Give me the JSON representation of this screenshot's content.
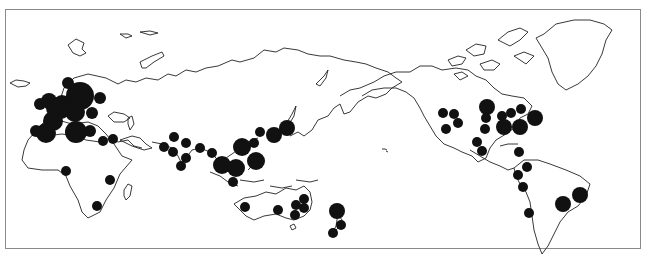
{
  "map": {
    "type": "proportional-symbol world map",
    "projection": "Pacific-centered (Europe/Africa at left, Americas at right)",
    "symbol_color": "#111111",
    "frame_color": "#8a8a8a",
    "regions": {
      "europe": [
        {
          "x": 68,
          "y": 83,
          "r": 6
        },
        {
          "x": 80,
          "y": 96,
          "r": 14
        },
        {
          "x": 62,
          "y": 104,
          "r": 9
        },
        {
          "x": 100,
          "y": 98,
          "r": 6
        },
        {
          "x": 40,
          "y": 104,
          "r": 6
        },
        {
          "x": 49,
          "y": 101,
          "r": 8
        },
        {
          "x": 56,
          "y": 108,
          "r": 10
        },
        {
          "x": 60,
          "y": 108,
          "r": 11
        },
        {
          "x": 75,
          "y": 112,
          "r": 10
        },
        {
          "x": 92,
          "y": 113,
          "r": 6
        },
        {
          "x": 53,
          "y": 121,
          "r": 10
        },
        {
          "x": 36,
          "y": 131,
          "r": 6
        },
        {
          "x": 46,
          "y": 133,
          "r": 10
        },
        {
          "x": 76,
          "y": 132,
          "r": 11
        },
        {
          "x": 90,
          "y": 131,
          "r": 6
        },
        {
          "x": 103,
          "y": 141,
          "r": 5
        },
        {
          "x": 113,
          "y": 139,
          "r": 5
        }
      ],
      "africa": [
        {
          "x": 66,
          "y": 171,
          "r": 5
        },
        {
          "x": 110,
          "y": 180,
          "r": 5
        },
        {
          "x": 97,
          "y": 206,
          "r": 5
        }
      ],
      "asia": [
        {
          "x": 174,
          "y": 137,
          "r": 5
        },
        {
          "x": 164,
          "y": 147,
          "r": 5
        },
        {
          "x": 186,
          "y": 143,
          "r": 5
        },
        {
          "x": 173,
          "y": 152,
          "r": 5
        },
        {
          "x": 186,
          "y": 158,
          "r": 5
        },
        {
          "x": 181,
          "y": 166,
          "r": 5
        },
        {
          "x": 200,
          "y": 148,
          "r": 5
        },
        {
          "x": 212,
          "y": 153,
          "r": 5
        },
        {
          "x": 222,
          "y": 165,
          "r": 9
        },
        {
          "x": 236,
          "y": 168,
          "r": 9
        },
        {
          "x": 242,
          "y": 147,
          "r": 9
        },
        {
          "x": 256,
          "y": 161,
          "r": 9
        },
        {
          "x": 254,
          "y": 143,
          "r": 5
        },
        {
          "x": 260,
          "y": 132,
          "r": 5
        },
        {
          "x": 274,
          "y": 135,
          "r": 8
        },
        {
          "x": 287,
          "y": 128,
          "r": 8
        },
        {
          "x": 233,
          "y": 182,
          "r": 5
        }
      ],
      "oceania": [
        {
          "x": 245,
          "y": 207,
          "r": 5
        },
        {
          "x": 278,
          "y": 210,
          "r": 5
        },
        {
          "x": 296,
          "y": 205,
          "r": 5
        },
        {
          "x": 304,
          "y": 199,
          "r": 5
        },
        {
          "x": 304,
          "y": 208,
          "r": 5
        },
        {
          "x": 295,
          "y": 215,
          "r": 5
        },
        {
          "x": 337,
          "y": 211,
          "r": 8
        },
        {
          "x": 341,
          "y": 225,
          "r": 5
        },
        {
          "x": 333,
          "y": 233,
          "r": 5
        }
      ],
      "north_america": [
        {
          "x": 443,
          "y": 113,
          "r": 5
        },
        {
          "x": 454,
          "y": 114,
          "r": 5
        },
        {
          "x": 458,
          "y": 123,
          "r": 5
        },
        {
          "x": 446,
          "y": 129,
          "r": 5
        },
        {
          "x": 487,
          "y": 107,
          "r": 8
        },
        {
          "x": 486,
          "y": 118,
          "r": 5
        },
        {
          "x": 485,
          "y": 129,
          "r": 5
        },
        {
          "x": 502,
          "y": 116,
          "r": 5
        },
        {
          "x": 511,
          "y": 113,
          "r": 5
        },
        {
          "x": 521,
          "y": 109,
          "r": 5
        },
        {
          "x": 504,
          "y": 127,
          "r": 8
        },
        {
          "x": 520,
          "y": 127,
          "r": 8
        },
        {
          "x": 535,
          "y": 118,
          "r": 8
        },
        {
          "x": 477,
          "y": 142,
          "r": 5
        },
        {
          "x": 482,
          "y": 151,
          "r": 5
        },
        {
          "x": 519,
          "y": 152,
          "r": 5
        }
      ],
      "south_america": [
        {
          "x": 527,
          "y": 167,
          "r": 5
        },
        {
          "x": 518,
          "y": 175,
          "r": 5
        },
        {
          "x": 523,
          "y": 187,
          "r": 5
        },
        {
          "x": 529,
          "y": 213,
          "r": 5
        },
        {
          "x": 563,
          "y": 204,
          "r": 8
        },
        {
          "x": 580,
          "y": 195,
          "r": 8
        }
      ]
    }
  }
}
